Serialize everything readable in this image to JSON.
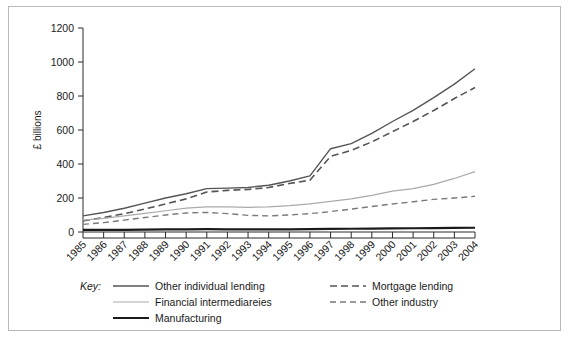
{
  "chart_data": {
    "type": "line",
    "title": "",
    "xlabel": "",
    "ylabel": "£ billions",
    "ylim": [
      0,
      1200
    ],
    "yticks": [
      0,
      200,
      400,
      600,
      800,
      1000,
      1200
    ],
    "ytick_labels": [
      "0",
      "200",
      "400",
      "600",
      "800",
      "1000",
      "1200"
    ],
    "grid": false,
    "legend_position": "below-plot",
    "legend_title": "Key:",
    "categories": [
      "1985",
      "1986",
      "1987",
      "1988",
      "1989",
      "1990",
      "1991",
      "1992",
      "1993",
      "1994",
      "1995",
      "1996",
      "1997",
      "1998",
      "1999",
      "2000",
      "2001",
      "2002",
      "2003",
      "2004"
    ],
    "series": [
      {
        "name": "Other individual lending",
        "style": "solid",
        "color": "#555555",
        "width": 1.4,
        "values": [
          95,
          115,
          140,
          170,
          200,
          225,
          255,
          258,
          262,
          275,
          300,
          330,
          490,
          520,
          580,
          650,
          715,
          790,
          870,
          960
        ]
      },
      {
        "name": "Mortgage lending",
        "style": "dashed",
        "color": "#555555",
        "width": 1.6,
        "values": [
          65,
          85,
          108,
          135,
          165,
          195,
          235,
          245,
          250,
          262,
          285,
          305,
          445,
          480,
          530,
          590,
          650,
          715,
          785,
          850
        ]
      },
      {
        "name": "Financial intermediareies",
        "style": "solid",
        "color": "#aaaaaa",
        "width": 1.2,
        "values": [
          70,
          80,
          95,
          110,
          125,
          140,
          148,
          148,
          145,
          148,
          155,
          165,
          180,
          195,
          215,
          240,
          255,
          280,
          315,
          355
        ]
      },
      {
        "name": "Other industry",
        "style": "dashed",
        "color": "#7a7a7a",
        "width": 1.4,
        "values": [
          45,
          55,
          70,
          85,
          100,
          112,
          115,
          108,
          98,
          95,
          100,
          108,
          120,
          135,
          150,
          165,
          178,
          192,
          200,
          210
        ]
      },
      {
        "name": "Manufacturing",
        "style": "solid",
        "color": "#1a1a1a",
        "width": 2.2,
        "values": [
          12,
          12,
          13,
          14,
          15,
          16,
          17,
          16,
          15,
          15,
          16,
          17,
          18,
          19,
          20,
          21,
          22,
          23,
          24,
          25
        ]
      }
    ],
    "legend_entries": [
      {
        "label": "Other individual lending",
        "style": "solid",
        "color": "#555555",
        "width": 1.4
      },
      {
        "label": "Mortgage lending",
        "style": "dashed",
        "color": "#555555",
        "width": 1.6
      },
      {
        "label": "Financial intermediareies",
        "style": "solid",
        "color": "#aaaaaa",
        "width": 1.2
      },
      {
        "label": "Other industry",
        "style": "dashed",
        "color": "#7a7a7a",
        "width": 1.4
      },
      {
        "label": "Manufacturing",
        "style": "solid",
        "color": "#1a1a1a",
        "width": 2.2
      }
    ]
  }
}
